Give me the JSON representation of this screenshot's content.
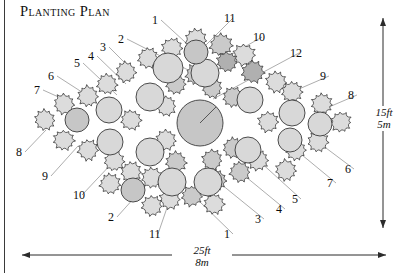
{
  "title": "Planting Plan",
  "dimensions": {
    "width_label_ft": "25ft",
    "width_label_m": "8m",
    "height_label_ft": "15ft",
    "height_label_m": "5m"
  },
  "colors": {
    "outline": "#3a3a3a",
    "leader": "#8a8a8a",
    "shrub_light": "#dcdcdc",
    "shrub_mid": "#cacaca",
    "shrub_dark": "#b0b0b0",
    "circle_light": "#d8d8d8",
    "circle_mid": "#c6c6c6",
    "background": "#ffffff"
  },
  "callouts": [
    {
      "label": "1",
      "x": 152,
      "y": 14,
      "tip_x": 196,
      "tip_y": 52
    },
    {
      "label": "11",
      "x": 224,
      "y": 12,
      "tip_x": 205,
      "tip_y": 46
    },
    {
      "label": "2",
      "x": 118,
      "y": 33,
      "tip_x": 196,
      "tip_y": 74
    },
    {
      "label": "3",
      "x": 100,
      "y": 41,
      "tip_x": 135,
      "tip_y": 73
    },
    {
      "label": "10",
      "x": 253,
      "y": 31,
      "tip_x": 227,
      "tip_y": 57
    },
    {
      "label": "12",
      "x": 290,
      "y": 47,
      "tip_x": 213,
      "tip_y": 99
    },
    {
      "label": "4",
      "x": 88,
      "y": 50,
      "tip_x": 126,
      "tip_y": 84
    },
    {
      "label": "5",
      "x": 74,
      "y": 57,
      "tip_x": 117,
      "tip_y": 95
    },
    {
      "label": "9",
      "x": 320,
      "y": 70,
      "tip_x": 292,
      "tip_y": 92
    },
    {
      "label": "6",
      "x": 48,
      "y": 70,
      "tip_x": 88,
      "tip_y": 96
    },
    {
      "label": "7",
      "x": 34,
      "y": 84,
      "tip_x": 74,
      "tip_y": 104
    },
    {
      "label": "8",
      "x": 348,
      "y": 89,
      "tip_x": 322,
      "tip_y": 110
    },
    {
      "label": "8",
      "x": 16,
      "y": 146,
      "tip_x": 46,
      "tip_y": 130
    },
    {
      "label": "6",
      "x": 345,
      "y": 163,
      "tip_x": 318,
      "tip_y": 142
    },
    {
      "label": "9",
      "x": 42,
      "y": 170,
      "tip_x": 78,
      "tip_y": 146
    },
    {
      "label": "7",
      "x": 327,
      "y": 177,
      "tip_x": 296,
      "tip_y": 150
    },
    {
      "label": "10",
      "x": 73,
      "y": 189,
      "tip_x": 114,
      "tip_y": 161
    },
    {
      "label": "5",
      "x": 292,
      "y": 193,
      "tip_x": 258,
      "tip_y": 160
    },
    {
      "label": "4",
      "x": 276,
      "y": 203,
      "tip_x": 240,
      "tip_y": 172
    },
    {
      "label": "2",
      "x": 108,
      "y": 211,
      "tip_x": 152,
      "tip_y": 178
    },
    {
      "label": "3",
      "x": 255,
      "y": 213,
      "tip_x": 216,
      "tip_y": 180
    },
    {
      "label": "11",
      "x": 149,
      "y": 228,
      "tip_x": 170,
      "tip_y": 199
    },
    {
      "label": "1",
      "x": 224,
      "y": 228,
      "tip_x": 198,
      "tip_y": 200
    }
  ],
  "chart_data": {
    "type": "diagram",
    "title": "Planting Plan",
    "plan_shape": "lens",
    "bed_width_px": 352,
    "bed_height_px": 160,
    "center_feature": {
      "type": "circle",
      "cx": 200,
      "cy": 123,
      "r": 23,
      "fill": "circle_mid"
    },
    "circles": [
      {
        "cx": 200,
        "cy": 123,
        "r": 23,
        "fill": "circle_mid",
        "radius_line": true
      },
      {
        "cx": 168,
        "cy": 68,
        "r": 15,
        "fill": "circle_light"
      },
      {
        "cx": 205,
        "cy": 73,
        "r": 14,
        "fill": "circle_light"
      },
      {
        "cx": 150,
        "cy": 97,
        "r": 14,
        "fill": "circle_light"
      },
      {
        "cx": 250,
        "cy": 100,
        "r": 13,
        "fill": "circle_light"
      },
      {
        "cx": 109,
        "cy": 110,
        "r": 13,
        "fill": "circle_light"
      },
      {
        "cx": 292,
        "cy": 113,
        "r": 13,
        "fill": "circle_light"
      },
      {
        "cx": 77,
        "cy": 120,
        "r": 12,
        "fill": "circle_mid"
      },
      {
        "cx": 320,
        "cy": 124,
        "r": 12,
        "fill": "circle_light"
      },
      {
        "cx": 110,
        "cy": 142,
        "r": 13,
        "fill": "circle_light"
      },
      {
        "cx": 290,
        "cy": 140,
        "r": 12,
        "fill": "circle_light"
      },
      {
        "cx": 150,
        "cy": 152,
        "r": 14,
        "fill": "circle_light"
      },
      {
        "cx": 248,
        "cy": 150,
        "r": 13,
        "fill": "circle_light"
      },
      {
        "cx": 172,
        "cy": 182,
        "r": 14,
        "fill": "circle_light"
      },
      {
        "cx": 208,
        "cy": 182,
        "r": 14,
        "fill": "circle_light"
      },
      {
        "cx": 133,
        "cy": 190,
        "r": 12,
        "fill": "circle_mid"
      },
      {
        "cx": 196,
        "cy": 52,
        "r": 12,
        "fill": "circle_mid"
      }
    ],
    "shrubs": [
      {
        "cx": 196,
        "cy": 40,
        "r": 12,
        "fill": "shrub_light"
      },
      {
        "cx": 221,
        "cy": 45,
        "r": 12,
        "fill": "shrub_mid"
      },
      {
        "cx": 172,
        "cy": 48,
        "r": 11,
        "fill": "shrub_light"
      },
      {
        "cx": 244,
        "cy": 55,
        "r": 12,
        "fill": "shrub_light"
      },
      {
        "cx": 148,
        "cy": 58,
        "r": 11,
        "fill": "shrub_light"
      },
      {
        "cx": 227,
        "cy": 62,
        "r": 11,
        "fill": "shrub_dark"
      },
      {
        "cx": 253,
        "cy": 72,
        "r": 12,
        "fill": "shrub_dark"
      },
      {
        "cx": 126,
        "cy": 72,
        "r": 11,
        "fill": "shrub_light"
      },
      {
        "cx": 196,
        "cy": 74,
        "r": 11,
        "fill": "shrub_mid"
      },
      {
        "cx": 176,
        "cy": 84,
        "r": 11,
        "fill": "shrub_mid"
      },
      {
        "cx": 212,
        "cy": 88,
        "r": 11,
        "fill": "shrub_mid"
      },
      {
        "cx": 107,
        "cy": 84,
        "r": 11,
        "fill": "shrub_light"
      },
      {
        "cx": 276,
        "cy": 82,
        "r": 11,
        "fill": "shrub_light"
      },
      {
        "cx": 88,
        "cy": 96,
        "r": 11,
        "fill": "shrub_light"
      },
      {
        "cx": 233,
        "cy": 97,
        "r": 11,
        "fill": "shrub_mid"
      },
      {
        "cx": 166,
        "cy": 106,
        "r": 11,
        "fill": "shrub_light"
      },
      {
        "cx": 292,
        "cy": 92,
        "r": 11,
        "fill": "shrub_light"
      },
      {
        "cx": 64,
        "cy": 104,
        "r": 11,
        "fill": "shrub_light"
      },
      {
        "cx": 322,
        "cy": 104,
        "r": 11,
        "fill": "shrub_light"
      },
      {
        "cx": 45,
        "cy": 120,
        "r": 11,
        "fill": "shrub_light"
      },
      {
        "cx": 341,
        "cy": 122,
        "r": 11,
        "fill": "shrub_light"
      },
      {
        "cx": 131,
        "cy": 120,
        "r": 11,
        "fill": "shrub_light"
      },
      {
        "cx": 268,
        "cy": 122,
        "r": 11,
        "fill": "shrub_light"
      },
      {
        "cx": 166,
        "cy": 140,
        "r": 11,
        "fill": "shrub_light"
      },
      {
        "cx": 233,
        "cy": 148,
        "r": 11,
        "fill": "shrub_mid"
      },
      {
        "cx": 64,
        "cy": 140,
        "r": 11,
        "fill": "shrub_light"
      },
      {
        "cx": 318,
        "cy": 142,
        "r": 11,
        "fill": "shrub_light"
      },
      {
        "cx": 88,
        "cy": 150,
        "r": 11,
        "fill": "shrub_light"
      },
      {
        "cx": 296,
        "cy": 150,
        "r": 11,
        "fill": "shrub_light"
      },
      {
        "cx": 212,
        "cy": 160,
        "r": 11,
        "fill": "shrub_mid"
      },
      {
        "cx": 176,
        "cy": 162,
        "r": 11,
        "fill": "shrub_mid"
      },
      {
        "cx": 114,
        "cy": 161,
        "r": 11,
        "fill": "shrub_light"
      },
      {
        "cx": 258,
        "cy": 160,
        "r": 11,
        "fill": "shrub_light"
      },
      {
        "cx": 131,
        "cy": 172,
        "r": 11,
        "fill": "shrub_light"
      },
      {
        "cx": 240,
        "cy": 172,
        "r": 11,
        "fill": "shrub_mid"
      },
      {
        "cx": 152,
        "cy": 178,
        "r": 11,
        "fill": "shrub_light"
      },
      {
        "cx": 216,
        "cy": 180,
        "r": 11,
        "fill": "shrub_mid"
      },
      {
        "cx": 192,
        "cy": 196,
        "r": 11,
        "fill": "shrub_mid"
      },
      {
        "cx": 170,
        "cy": 199,
        "r": 11,
        "fill": "shrub_light"
      },
      {
        "cx": 152,
        "cy": 206,
        "r": 11,
        "fill": "shrub_light"
      },
      {
        "cx": 214,
        "cy": 204,
        "r": 11,
        "fill": "shrub_light"
      },
      {
        "cx": 110,
        "cy": 184,
        "r": 11,
        "fill": "shrub_light"
      },
      {
        "cx": 286,
        "cy": 170,
        "r": 11,
        "fill": "shrub_light"
      }
    ]
  }
}
